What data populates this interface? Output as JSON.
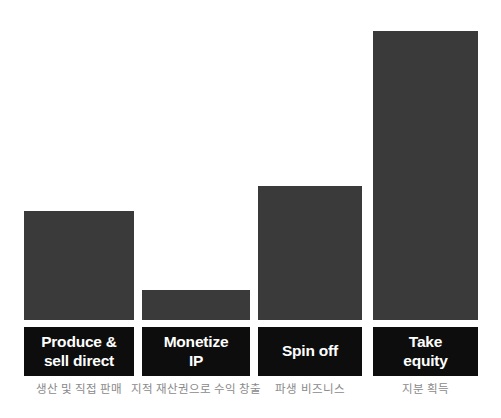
{
  "chart_data": {
    "type": "bar",
    "title": "",
    "subtitle": "",
    "xlabel": "",
    "ylabel": "",
    "grid": false,
    "legend": "none",
    "ylim": [
      0,
      289
    ],
    "categories": [
      "Produce &\nsell direct",
      "Monetize\nIP",
      "Spin off",
      "Take\nequity"
    ],
    "values": [
      109,
      30,
      134,
      289
    ],
    "bar_color": "#3a3a3a",
    "label_box_color": "#0d0d0d",
    "label_text_color": "#ffffff",
    "caption_color": "#8a8a8a",
    "background": "#ffffff",
    "annotations": [
      "생산 및 직접 판매",
      "지적 재산권으로 수익 창출",
      "파생 비즈니스",
      "지분 획득"
    ]
  },
  "bars": [
    {
      "label": "Produce &\nsell direct",
      "caption": "생산 및 직접 판매",
      "value": 109,
      "left": 24,
      "width": 110,
      "top": 211,
      "height": 109
    },
    {
      "label": "Monetize\nIP",
      "caption": "지적 재산권으로 수익 창출",
      "value": 30,
      "left": 142,
      "width": 108,
      "top": 290,
      "height": 30
    },
    {
      "label": "Spin off",
      "caption": "파생 비즈니스",
      "value": 134,
      "left": 258,
      "width": 104,
      "top": 186,
      "height": 134
    },
    {
      "label": "Take\nequity",
      "caption": "지분 획득",
      "value": 289,
      "left": 373,
      "width": 105,
      "top": 31,
      "height": 289
    }
  ]
}
